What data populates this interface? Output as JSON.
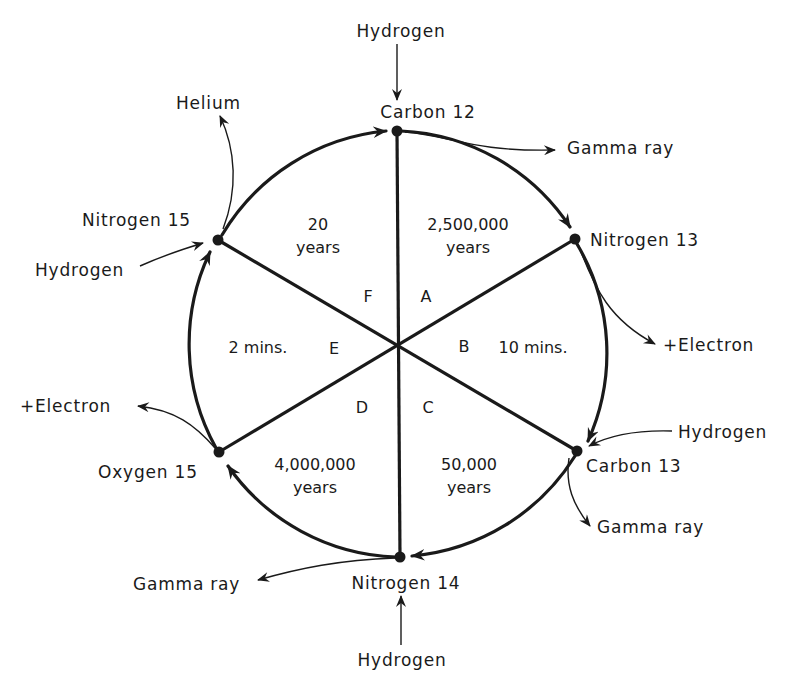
{
  "diagram": {
    "nodes": [
      {
        "id": "carbon-12",
        "label": "Carbon 12"
      },
      {
        "id": "nitrogen-13",
        "label": "Nitrogen 13"
      },
      {
        "id": "carbon-13",
        "label": "Carbon 13"
      },
      {
        "id": "nitrogen-14",
        "label": "Nitrogen 14"
      },
      {
        "id": "oxygen-15",
        "label": "Oxygen 15"
      },
      {
        "id": "nitrogen-15",
        "label": "Nitrogen 15"
      }
    ],
    "sectors": [
      {
        "letter": "A",
        "duration_line1": "2,500,000",
        "duration_line2": "years"
      },
      {
        "letter": "B",
        "duration_line1": "10 mins.",
        "duration_line2": ""
      },
      {
        "letter": "C",
        "duration_line1": "50,000",
        "duration_line2": "years"
      },
      {
        "letter": "D",
        "duration_line1": "4,000,000",
        "duration_line2": "years"
      },
      {
        "letter": "E",
        "duration_line1": "2 mins.",
        "duration_line2": ""
      },
      {
        "letter": "F",
        "duration_line1": "20",
        "duration_line2": "years"
      }
    ],
    "inputs_outputs": [
      {
        "node": "carbon-12",
        "direction": "in",
        "label": "Hydrogen"
      },
      {
        "node": "carbon-12",
        "direction": "out",
        "label": "Gamma ray"
      },
      {
        "node": "nitrogen-13",
        "direction": "out",
        "label": "+Electron"
      },
      {
        "node": "carbon-13",
        "direction": "in",
        "label": "Hydrogen"
      },
      {
        "node": "carbon-13",
        "direction": "out",
        "label": "Gamma ray"
      },
      {
        "node": "nitrogen-14",
        "direction": "in",
        "label": "Hydrogen"
      },
      {
        "node": "nitrogen-14",
        "direction": "out",
        "label": "Gamma ray"
      },
      {
        "node": "oxygen-15",
        "direction": "out",
        "label": "+Electron"
      },
      {
        "node": "nitrogen-15",
        "direction": "in",
        "label": "Hydrogen"
      },
      {
        "node": "nitrogen-15",
        "direction": "out",
        "label": "Helium"
      }
    ]
  }
}
